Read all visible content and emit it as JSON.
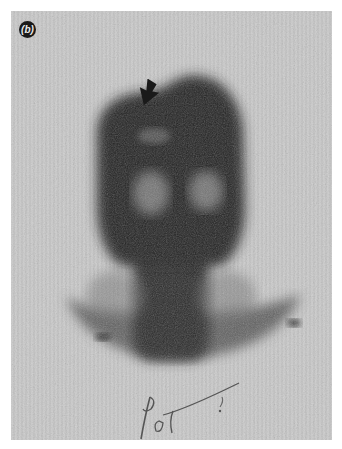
{
  "figure": {
    "panel_label": "(b)",
    "annotation_arrow": "arrow-icon",
    "handwritten_note": "Post",
    "colors": {
      "background": "#c9c9c9",
      "uptake_dark": "#1c1c1c",
      "page": "#ffffff"
    }
  }
}
